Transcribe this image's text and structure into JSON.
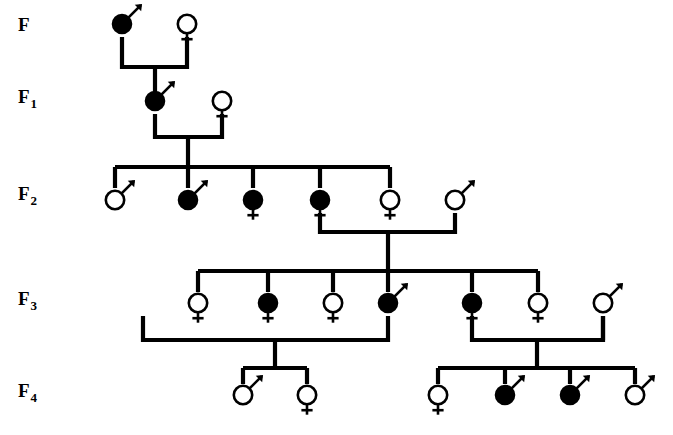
{
  "diagram": {
    "type": "pedigree",
    "background_color": "#ffffff",
    "line_color": "#000000",
    "affected_fill": "#000000",
    "unaffected_fill": "#ffffff",
    "legend_semantics": {
      "filled_symbol": "affected individual",
      "open_symbol": "unaffected individual",
      "male_glyph": "circle with upper-right arrow (Mars)",
      "female_glyph": "circle with downward cross (Venus)"
    }
  },
  "generations": [
    {
      "id": "F",
      "label": "F",
      "subscript": "",
      "label_x": 18,
      "label_y": 31,
      "symbol_y": 24,
      "individuals": [
        {
          "name": "f-male-1",
          "sex": "male",
          "status": "affected",
          "x": 122
        },
        {
          "name": "f-female-1",
          "sex": "female",
          "status": "unaffected",
          "x": 187
        }
      ]
    },
    {
      "id": "F1",
      "label": "F",
      "subscript": "1",
      "label_x": 18,
      "label_y": 103,
      "symbol_y": 101,
      "individuals": [
        {
          "name": "f1-male-1",
          "sex": "male",
          "status": "affected",
          "x": 155
        },
        {
          "name": "f1-female-1",
          "sex": "female",
          "status": "unaffected",
          "x": 222
        }
      ]
    },
    {
      "id": "F2",
      "label": "F",
      "subscript": "2",
      "label_x": 18,
      "label_y": 200,
      "symbol_y": 200,
      "individuals": [
        {
          "name": "f2-male-1",
          "sex": "male",
          "status": "unaffected",
          "x": 115
        },
        {
          "name": "f2-male-2",
          "sex": "male",
          "status": "affected",
          "x": 188
        },
        {
          "name": "f2-female-1",
          "sex": "female",
          "status": "affected",
          "x": 253
        },
        {
          "name": "f2-female-2",
          "sex": "female",
          "status": "affected",
          "x": 320
        },
        {
          "name": "f2-female-3",
          "sex": "female",
          "status": "unaffected",
          "x": 390
        },
        {
          "name": "f2-male-3",
          "sex": "male",
          "status": "unaffected",
          "x": 455
        }
      ]
    },
    {
      "id": "F3",
      "label": "F",
      "subscript": "3",
      "label_x": 18,
      "label_y": 305,
      "symbol_y": 303,
      "individuals": [
        {
          "name": "f3-female-1",
          "sex": "female",
          "status": "unaffected",
          "x": 198
        },
        {
          "name": "f3-female-2",
          "sex": "female",
          "status": "affected",
          "x": 268
        },
        {
          "name": "f3-female-3",
          "sex": "female",
          "status": "unaffected",
          "x": 333
        },
        {
          "name": "f3-male-1",
          "sex": "male",
          "status": "affected",
          "x": 388
        },
        {
          "name": "f3-female-4",
          "sex": "female",
          "status": "affected",
          "x": 472
        },
        {
          "name": "f3-female-5",
          "sex": "female",
          "status": "unaffected",
          "x": 538
        },
        {
          "name": "f3-male-2",
          "sex": "male",
          "status": "unaffected",
          "x": 603
        }
      ]
    },
    {
      "id": "F4",
      "label": "F",
      "subscript": "4",
      "label_x": 18,
      "label_y": 397,
      "symbol_y": 395,
      "individuals": [
        {
          "name": "f4-male-1",
          "sex": "male",
          "status": "unaffected",
          "x": 243
        },
        {
          "name": "f4-female-1",
          "sex": "female",
          "status": "unaffected",
          "x": 307
        },
        {
          "name": "f4-female-2",
          "sex": "female",
          "status": "unaffected",
          "x": 438
        },
        {
          "name": "f4-male-2",
          "sex": "male",
          "status": "affected",
          "x": 505
        },
        {
          "name": "f4-male-3",
          "sex": "male",
          "status": "affected",
          "x": 570
        },
        {
          "name": "f4-male-4",
          "sex": "male",
          "status": "unaffected",
          "x": 635
        }
      ]
    }
  ],
  "matings": [
    {
      "name": "mating-F",
      "left_x": 122,
      "right_x": 187,
      "partner_y": 37,
      "line_y": 67,
      "descent_x": 155,
      "descent_to_y": 92
    },
    {
      "name": "mating-F1",
      "left_x": 155,
      "right_x": 222,
      "partner_y": 114,
      "line_y": 137,
      "descent_x": 188,
      "descent_to_y": 167
    },
    {
      "name": "mating-F2",
      "left_x": 320,
      "right_x": 455,
      "partner_y": 213,
      "line_y": 232,
      "descent_x": 388,
      "descent_to_y": 271
    },
    {
      "name": "mating-F3-left",
      "left_x": 143,
      "right_x": 388,
      "partner_y": 316,
      "line_y": 340,
      "descent_x": 275,
      "descent_to_y": 368
    },
    {
      "name": "mating-F3-right",
      "left_x": 472,
      "right_x": 603,
      "partner_y": 316,
      "line_y": 340,
      "descent_x": 537,
      "descent_to_y": 368
    }
  ],
  "sibships": [
    {
      "name": "sibship-F2",
      "bar_y": 167,
      "drop_to_y": 188,
      "children_x": [
        115,
        188,
        253,
        320,
        390
      ]
    },
    {
      "name": "sibship-F3",
      "bar_y": 271,
      "drop_to_y": 292,
      "children_x": [
        198,
        268,
        333,
        388,
        472,
        538
      ]
    },
    {
      "name": "sibship-F4-left",
      "bar_y": 368,
      "drop_to_y": 384,
      "children_x": [
        243,
        307
      ]
    },
    {
      "name": "sibship-F4-right",
      "bar_y": 368,
      "drop_to_y": 384,
      "children_x": [
        438,
        505,
        570,
        635
      ]
    }
  ],
  "spouse_drops": [
    {
      "name": "spouse-drop-f3-male-2",
      "x": 603,
      "from_y": 316,
      "to_y": 340
    }
  ]
}
